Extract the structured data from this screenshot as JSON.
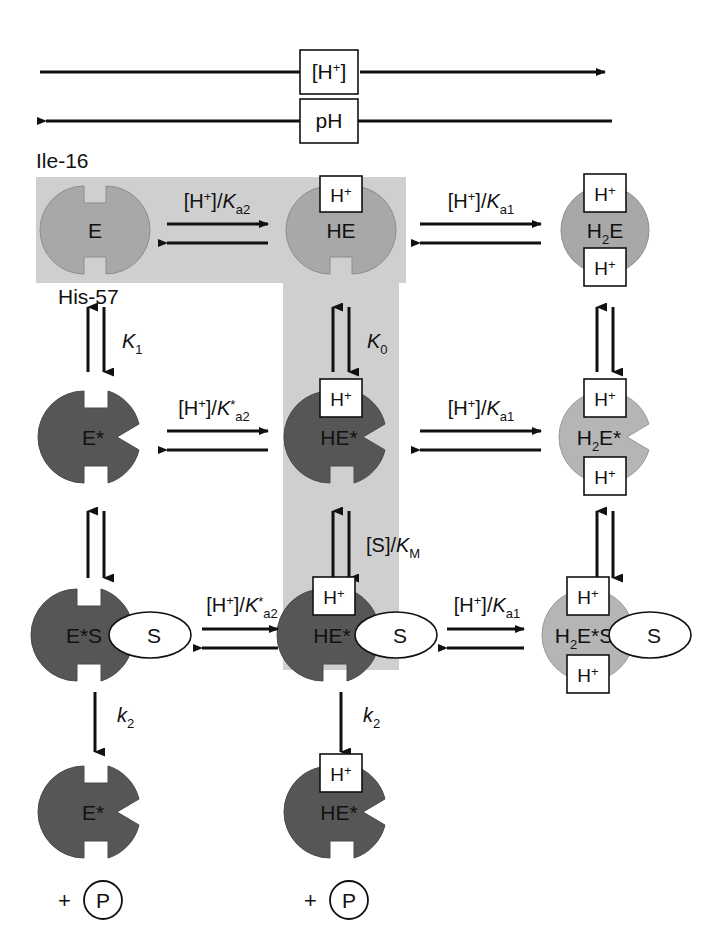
{
  "figure": {
    "axes": [
      {
        "name": "h-plus-axis",
        "label": "[H+]",
        "label_html": "[H<sup>+</sup>]",
        "direction": "right"
      },
      {
        "name": "ph-axis",
        "label": "pH",
        "label_html": "pH",
        "direction": "left"
      }
    ],
    "residue_labels": [
      {
        "name": "ile-16",
        "text": "Ile-16"
      },
      {
        "name": "his-57",
        "text": "His-57"
      }
    ],
    "colors": {
      "band_gray": "#cfcfcf",
      "enzyme_light_gray": "#a8a8a8",
      "enzyme_dark_gray": "#565656",
      "enzyme_mid_gray": "#b5b5b5",
      "stroke": "#111111",
      "white": "#ffffff"
    },
    "species": [
      {
        "name": "E",
        "label": "E",
        "row": 1,
        "col": 1,
        "fill": "light",
        "protons": 0,
        "wedge": false,
        "substrate": false
      },
      {
        "name": "HE",
        "label": "HE",
        "row": 1,
        "col": 2,
        "fill": "light",
        "protons": 1,
        "wedge": false,
        "substrate": false
      },
      {
        "name": "H2E",
        "label": "H2E",
        "row": 1,
        "col": 3,
        "fill": "light",
        "protons": 2,
        "wedge": false,
        "substrate": false
      },
      {
        "name": "E-star",
        "label": "E*",
        "row": 2,
        "col": 1,
        "fill": "dark",
        "protons": 0,
        "wedge": true,
        "substrate": false
      },
      {
        "name": "HE-star",
        "label": "HE*",
        "row": 2,
        "col": 2,
        "fill": "dark",
        "protons": 1,
        "wedge": true,
        "substrate": false
      },
      {
        "name": "H2E-star",
        "label": "H2E*",
        "row": 2,
        "col": 3,
        "fill": "mid",
        "protons": 2,
        "wedge": true,
        "substrate": false
      },
      {
        "name": "E-star-S",
        "label": "E*S",
        "row": 3,
        "col": 1,
        "fill": "dark",
        "protons": 0,
        "wedge": true,
        "substrate": true
      },
      {
        "name": "HE-star-S",
        "label": "HE*",
        "row": 3,
        "col": 2,
        "fill": "dark",
        "protons": 1,
        "wedge": true,
        "substrate": true
      },
      {
        "name": "H2E-star-S",
        "label": "H2E*S",
        "row": 3,
        "col": 3,
        "fill": "mid",
        "protons": 2,
        "wedge": true,
        "substrate": true
      },
      {
        "name": "E-star-product",
        "label": "E*",
        "row": 4,
        "col": 1,
        "fill": "dark",
        "protons": 0,
        "wedge": true,
        "substrate": false
      },
      {
        "name": "HE-star-product",
        "label": "HE*",
        "row": 4,
        "col": 2,
        "fill": "dark",
        "protons": 1,
        "wedge": true,
        "substrate": false
      }
    ],
    "proton_box_label": "H+",
    "substrate_label": "S",
    "product_label": "P",
    "plus_sign": "+",
    "horizontal_equilibria": [
      {
        "name": "eq-E-HE",
        "row": 1,
        "between": [
          "E",
          "HE"
        ],
        "label": "[H+]/Ka2"
      },
      {
        "name": "eq-HE-H2E",
        "row": 1,
        "between": [
          "HE",
          "H2E"
        ],
        "label": "[H+]/Ka1"
      },
      {
        "name": "eq-Estar-HEstar",
        "row": 2,
        "between": [
          "E*",
          "HE*"
        ],
        "label": "[H+]/K*a2"
      },
      {
        "name": "eq-HEstar-H2Estar",
        "row": 2,
        "between": [
          "HE*",
          "H2E*"
        ],
        "label": "[H+]/Ka1"
      },
      {
        "name": "eq-EstarS-HEstarS",
        "row": 3,
        "between": [
          "E*S",
          "HE*S"
        ],
        "label": "[H+]/K*a2"
      },
      {
        "name": "eq-HEstarS-H2EstarS",
        "row": 3,
        "between": [
          "HE*S",
          "H2E*S"
        ],
        "label": "[H+]/Ka1"
      }
    ],
    "vertical_equilibria": [
      {
        "name": "eq-E-Estar",
        "col": 1,
        "label": "K1"
      },
      {
        "name": "eq-HE-HEstar",
        "col": 2,
        "label": "K0"
      },
      {
        "name": "eq-H2E-H2Estar",
        "col": 3,
        "label": ""
      },
      {
        "name": "eq-Estar-EstarS",
        "col": 1,
        "label": ""
      },
      {
        "name": "eq-HEstar-HEstarS",
        "col": 2,
        "label": "[S]/KM"
      },
      {
        "name": "eq-H2Estar-H2EstarS",
        "col": 3,
        "label": ""
      }
    ],
    "catalytic_steps": [
      {
        "name": "k2-left",
        "col": 1,
        "label": "k2"
      },
      {
        "name": "k2-middle",
        "col": 2,
        "label": "k2"
      }
    ],
    "gray_regions": [
      {
        "name": "top-band",
        "x": 36,
        "y": 177,
        "w": 370,
        "h": 106
      },
      {
        "name": "middle-column",
        "x": 283,
        "y": 177,
        "w": 116,
        "h": 493
      }
    ]
  }
}
